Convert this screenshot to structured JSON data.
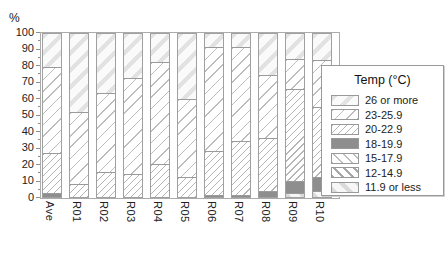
{
  "page": {
    "background": "#ffffff"
  },
  "chart_data": {
    "type": "bar",
    "stacked": true,
    "orientation": "vertical",
    "title": "",
    "xlabel": "",
    "ylabel": "%",
    "ylim": [
      0,
      100
    ],
    "ytick_major": 10,
    "ytick_minor": 5,
    "grid": false,
    "categories": [
      "Ave",
      "R01",
      "R02",
      "R03",
      "R04",
      "R05",
      "R06",
      "R07",
      "R08",
      "R09",
      "R10"
    ],
    "legend": {
      "title": "Temp (°C)",
      "position": "right"
    },
    "series": [
      {
        "name": "26 or more",
        "pattern": "diag-wide-light",
        "values": [
          20,
          48,
          36,
          27,
          17,
          40,
          8,
          8,
          25,
          15.5,
          16
        ]
      },
      {
        "name": "23-25.9",
        "pattern": "diag-thin-sparse",
        "values": [
          53,
          44,
          48.5,
          59,
          63,
          48,
          63.5,
          57.5,
          38.5,
          18,
          29
        ]
      },
      {
        "name": "20-22.9",
        "pattern": "diag-thin-dense",
        "values": [
          24.5,
          8,
          15.5,
          14,
          20,
          12,
          27,
          33,
          33,
          57,
          43
        ]
      },
      {
        "name": "18-19.9",
        "pattern": "solid-dark",
        "values": [
          2.5,
          0,
          0,
          0,
          0,
          0,
          1.5,
          1.5,
          3.5,
          7,
          8.5
        ]
      },
      {
        "name": "15-17.9",
        "pattern": "backdiag-thin-sparse",
        "values": [
          0,
          0,
          0,
          0,
          0,
          0,
          0,
          0,
          0,
          0,
          0
        ]
      },
      {
        "name": "12-14.9",
        "pattern": "backdiag-thin-dense",
        "values": [
          0,
          0,
          0,
          0,
          0,
          0,
          0,
          0,
          0,
          0,
          0
        ]
      },
      {
        "name": "11.9 or less",
        "pattern": "backdiag-wide-light",
        "values": [
          0,
          0,
          0,
          0,
          0,
          0,
          0,
          0,
          0,
          2.5,
          3.5
        ]
      }
    ],
    "stack_order_bottom_to_top": [
      "11.9 or less",
      "12-14.9",
      "15-17.9",
      "18-19.9",
      "20-22.9",
      "23-25.9",
      "26 or more"
    ]
  },
  "colors": {
    "text": "#222222",
    "axis": "#8f8f8f",
    "bar_border": "#a0a0a0",
    "segment_line": "#9a9a9a",
    "solid_fill": "#8e8e8e",
    "legend_border": "#999999"
  }
}
